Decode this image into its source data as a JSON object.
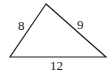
{
  "diagram": {
    "type": "triangle",
    "sides": [
      {
        "name": "left",
        "label": "8"
      },
      {
        "name": "right",
        "label": "9"
      },
      {
        "name": "bottom",
        "label": "12"
      }
    ],
    "stroke_color": "#222222"
  }
}
